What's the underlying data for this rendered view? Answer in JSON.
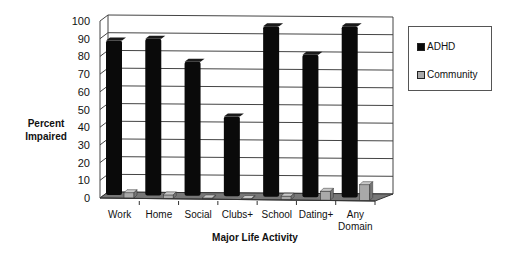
{
  "chart_data": {
    "type": "bar",
    "title": "",
    "xlabel": "Major Life Activity",
    "ylabel": "Percent Impaired",
    "ylim": [
      0,
      100
    ],
    "yticks": [
      0,
      10,
      20,
      30,
      40,
      50,
      60,
      70,
      80,
      90,
      100
    ],
    "categories": [
      "Work",
      "Home",
      "Social",
      "Clubs+",
      "School",
      "Dating+",
      "Any Domain"
    ],
    "series": [
      {
        "name": "ADHD",
        "color": "#0a0a0a",
        "values": [
          89,
          90,
          77,
          46,
          97,
          81,
          97
        ]
      },
      {
        "name": "Community",
        "color": "#a9a9a9",
        "values": [
          3,
          2,
          0.5,
          0,
          2,
          5,
          9
        ]
      }
    ],
    "grid": true,
    "legend_position": "right",
    "style": "3d-clustered"
  },
  "legend": {
    "items": [
      {
        "label": "ADHD",
        "color": "#0a0a0a"
      },
      {
        "label": "Community",
        "color": "#a9a9a9"
      }
    ]
  },
  "axes": {
    "x_title": "Major Life Activity",
    "y_title_line1": "Percent",
    "y_title_line2": "Impaired"
  }
}
